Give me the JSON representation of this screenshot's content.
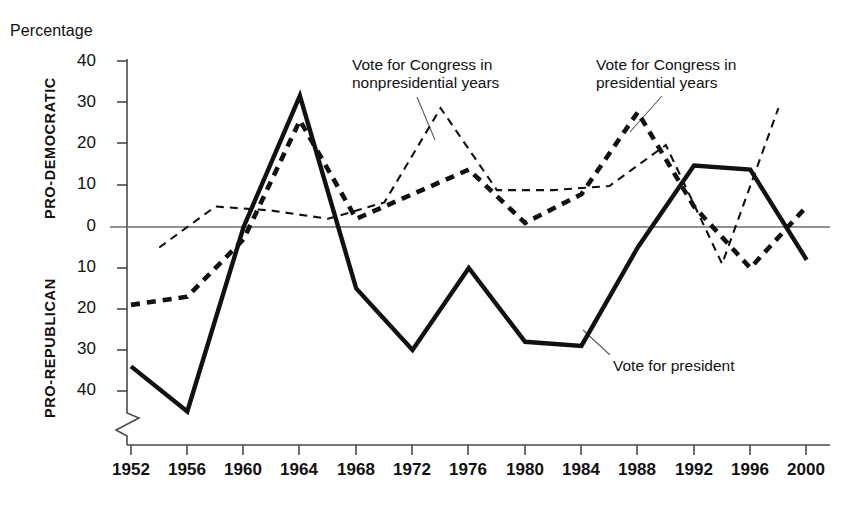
{
  "figure": {
    "y_axis_caption": "Percentage",
    "direction_label_upper": "PRO-DEMOCRATIC",
    "direction_label_lower": "PRO-REPUBLICAN"
  },
  "annotations": {
    "nonpresidential": "Vote for Congress in\nnonpresidential years",
    "presidential": "Vote for Congress in\npresidential years",
    "president": "Vote for president"
  },
  "chart_data": {
    "type": "line",
    "title": "",
    "xlabel": "",
    "ylabel": "Percentage",
    "grid": false,
    "legend_position": "inline-annotations",
    "axis_break": true,
    "x": [
      1952,
      1956,
      1960,
      1964,
      1968,
      1972,
      1976,
      1980,
      1984,
      1988,
      1992,
      1996,
      2000
    ],
    "xticklabels": [
      "1952",
      "1956",
      "1960",
      "1964",
      "1968",
      "1972",
      "1976",
      "1980",
      "1984",
      "1988",
      "1992",
      "1996",
      "2000"
    ],
    "xlim": [
      1952,
      2000
    ],
    "ylim": [
      -46,
      40
    ],
    "yticks": [
      40,
      30,
      20,
      10,
      0,
      -10,
      -20,
      -30,
      -40
    ],
    "yticklabels": [
      "40",
      "30",
      "20",
      "10",
      "0",
      "10",
      "20",
      "30",
      "40"
    ],
    "ytick_note": "values below 0 are labelled as positive magnitudes (pro-Republican)",
    "series": [
      {
        "name": "Vote for president",
        "style": "solid-thick",
        "x": [
          1952,
          1956,
          1960,
          1964,
          1968,
          1972,
          1976,
          1980,
          1984,
          1988,
          1992,
          1996,
          2000
        ],
        "values": [
          -34,
          -45,
          0,
          32,
          -15,
          -30,
          -10,
          -28,
          -29,
          -5,
          15,
          14,
          -8
        ]
      },
      {
        "name": "Vote for Congress in presidential years",
        "style": "dashed-thick",
        "x": [
          1952,
          1956,
          1960,
          1964,
          1968,
          1972,
          1976,
          1980,
          1984,
          1988,
          1992,
          1996,
          2000
        ],
        "values": [
          -19,
          -17,
          -3,
          26,
          2,
          8,
          14,
          1,
          8,
          28,
          5,
          -10,
          5
        ]
      },
      {
        "name": "Vote for Congress in nonpresidential years",
        "style": "dashed-thin",
        "x": [
          1954,
          1958,
          1962,
          1966,
          1970,
          1974,
          1978,
          1982,
          1986,
          1990,
          1994,
          1998
        ],
        "values": [
          -5,
          5,
          4,
          2,
          6,
          29,
          9,
          9,
          10,
          20,
          -9,
          29
        ]
      }
    ]
  }
}
